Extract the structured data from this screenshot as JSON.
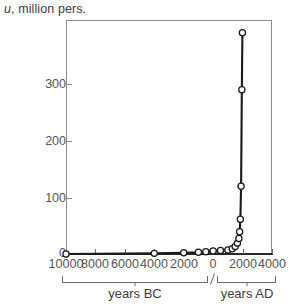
{
  "chart_data": {
    "type": "line",
    "title": "",
    "ylabel": "u, million pers.",
    "xlabel": "",
    "x_range_labels": [
      "years BC",
      "years AD"
    ],
    "ylim": [
      0,
      412
    ],
    "xlim": [
      -10000,
      4000
    ],
    "grid": false,
    "legend": null,
    "markers": "open-circle",
    "y_ticks": [
      0,
      100,
      200,
      300
    ],
    "y_tick_labels": [
      "0",
      "100",
      "200",
      "300"
    ],
    "x_ticks": [
      -10000,
      -8000,
      -6000,
      -4000,
      -2000,
      0,
      2000,
      4000
    ],
    "x_tick_labels": [
      "10000",
      "8000",
      "6000",
      "4000",
      "2000",
      "0",
      "2000",
      "4000"
    ],
    "x": [
      -10000,
      -4000,
      -2000,
      -1000,
      -500,
      0,
      500,
      1000,
      1300,
      1500,
      1650,
      1750,
      1800,
      1850,
      1900,
      1950,
      1990
    ],
    "values": [
      1,
      2,
      3,
      4,
      5,
      6,
      7,
      8,
      10,
      14,
      20,
      28,
      40,
      62,
      120,
      290,
      390
    ],
    "series": [
      {
        "name": "u",
        "values": [
          1,
          2,
          3,
          4,
          5,
          6,
          7,
          8,
          10,
          14,
          20,
          28,
          40,
          62,
          120,
          290,
          390
        ]
      }
    ]
  },
  "axes": {
    "y_caption_var": "u",
    "y_caption_rest": ", million pers.",
    "y_labels": [
      "300",
      "200",
      "100",
      "0"
    ],
    "x_labels": [
      "10000",
      "8000",
      "6000",
      "4000",
      "2000",
      "0",
      "2000",
      "4000"
    ],
    "range_bc": "years BC",
    "range_ad": "years AD"
  },
  "colors": {
    "frame": "#8d8d8d",
    "data_line": "#1a1a1a",
    "marker_fill": "#ffffff",
    "marker_stroke": "#1a1a1a",
    "tick_label": "#555555",
    "caption": "#3d3d3d",
    "background": "#ffffff"
  }
}
